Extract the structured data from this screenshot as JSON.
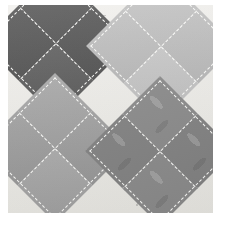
{
  "page": {
    "background_color": "#ffffff",
    "width": 227,
    "height": 226
  },
  "photo": {
    "alt_name": "quilt-block-photograph",
    "background_fabric": {
      "name": "cream leaf-print background fabric",
      "color": "#edece8",
      "motif": "small grey leaf sprigs"
    },
    "block_pattern": "four overlapping on-point squares (diamonds), each quartered by white dashed quilting stitches",
    "stitch_color": "#fdfdfb",
    "stitch_style": "white dashed hand-quilting",
    "diamonds": [
      {
        "position": "top-left",
        "label": "dark grey diamond",
        "color": "#5a5a5a",
        "quadrants": [
          {
            "name": "top",
            "color": "#626262"
          },
          {
            "name": "right",
            "color": "#545454"
          },
          {
            "name": "left",
            "color": "#5a5a5a"
          },
          {
            "name": "bottom",
            "color": "#4e4e4e"
          }
        ]
      },
      {
        "position": "top-right",
        "label": "light grey diamond",
        "color": "#c2c2c2",
        "quadrants": [
          {
            "name": "top",
            "color": "#c9c9c9"
          },
          {
            "name": "right",
            "color": "#bdbdbd"
          },
          {
            "name": "left",
            "color": "#c3c3c3"
          },
          {
            "name": "bottom",
            "color": "#b6b6b6"
          }
        ]
      },
      {
        "position": "bottom-left",
        "label": "medium grey diamond",
        "color": "#a8a8a8",
        "quadrants": [
          {
            "name": "top",
            "color": "#ababab"
          },
          {
            "name": "right",
            "color": "#9e9e9e"
          },
          {
            "name": "left",
            "color": "#a3a3a3"
          },
          {
            "name": "bottom",
            "color": "#969696"
          }
        ]
      },
      {
        "position": "bottom-right",
        "label": "textured printed grey diamond",
        "color": "#8a8a8a",
        "quadrants": [
          {
            "name": "top",
            "color": "#8b8b8b"
          },
          {
            "name": "right",
            "color": "#828282"
          },
          {
            "name": "left",
            "color": "#8b8b8b"
          },
          {
            "name": "bottom",
            "color": "#828282"
          }
        ]
      }
    ]
  },
  "caption": {
    "text": "",
    "note_visible": "caption row is clipped by the bottom edge of the image"
  }
}
